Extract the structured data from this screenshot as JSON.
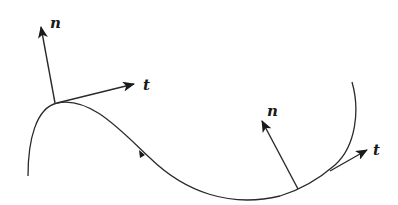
{
  "diagram": {
    "stroke_color": "#2a2a2a",
    "background": "#ffffff",
    "labels": {
      "left_normal": "n",
      "left_tangent": "t",
      "right_normal": "n",
      "right_tangent": "t"
    },
    "points": [
      {
        "name": "left-point",
        "x": 57,
        "y": 103
      },
      {
        "name": "right-point",
        "x": 298,
        "y": 189
      }
    ]
  }
}
